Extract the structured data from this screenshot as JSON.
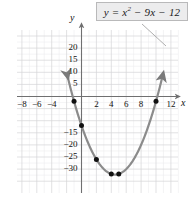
{
  "figure": {
    "equation_label": {
      "text": "y = x² − 9x − 12",
      "base": "y = x",
      "exponent": "2",
      "rest": " − 9x − 12",
      "box_fill": "#ececed",
      "box_border": "#b9b9ba"
    },
    "axis_names": {
      "x": "x",
      "y": "y"
    },
    "colors": {
      "curve": "#8b8b8b",
      "point": "#111111",
      "axis": "#6f6f70",
      "grid_major": "#d3d3d6",
      "grid_minor": "#ebebee",
      "background": "#ffffff",
      "leader_line": "#9a9a9a"
    }
  },
  "chart_data": {
    "type": "line",
    "title": "",
    "subtitle": "",
    "xlabel": "x",
    "ylabel": "y",
    "equation": "y = x^2 - 9x - 12",
    "xlim": [
      -10,
      14
    ],
    "ylim": [
      -35,
      25
    ],
    "xticks": [
      -8,
      -6,
      -4,
      2,
      4,
      6,
      8,
      12
    ],
    "yticks": [
      20,
      15,
      10,
      5,
      -15,
      -20,
      -25,
      -30
    ],
    "xtick_labels": [
      "−8",
      "−6",
      "−4",
      "2",
      "4",
      "6",
      "8",
      "12"
    ],
    "ytick_labels": [
      "20",
      "15",
      "10",
      "5",
      "−15",
      "−20",
      "−25",
      "−30"
    ],
    "grid": true,
    "grid_major_step_x": 2,
    "grid_major_step_y": 5,
    "grid_minor_step_x": 1,
    "grid_minor_step_y": 2.5,
    "legend": "none",
    "series": [
      {
        "name": "y = x² − 9x − 12",
        "type": "parabola",
        "a": 1,
        "b": -9,
        "c": -12,
        "vertex": [
          4.5,
          -32.25
        ],
        "roots": [
          -1.18,
          10.18
        ],
        "curve_x_start": -1.9,
        "curve_x_end": 10.9
      }
    ],
    "points": [
      {
        "x": -1,
        "y": -2,
        "label": ""
      },
      {
        "x": 0,
        "y": -12,
        "label": ""
      },
      {
        "x": 2,
        "y": -26,
        "label": ""
      },
      {
        "x": 4,
        "y": -32,
        "label": ""
      },
      {
        "x": 5,
        "y": -32,
        "label": ""
      },
      {
        "x": 10,
        "y": -2,
        "label": ""
      }
    ]
  }
}
